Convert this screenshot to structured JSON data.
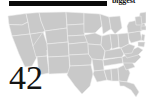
{
  "header": {
    "redaction_bar_color": "#0a0a0a",
    "title": "biggest"
  },
  "map": {
    "region_name": "united-states",
    "state_fill_color": "#c9c9c9",
    "state_border_color": "#efefef",
    "background_color": "#ffffff"
  },
  "overlay": {
    "number": "42",
    "color": "#141414"
  }
}
